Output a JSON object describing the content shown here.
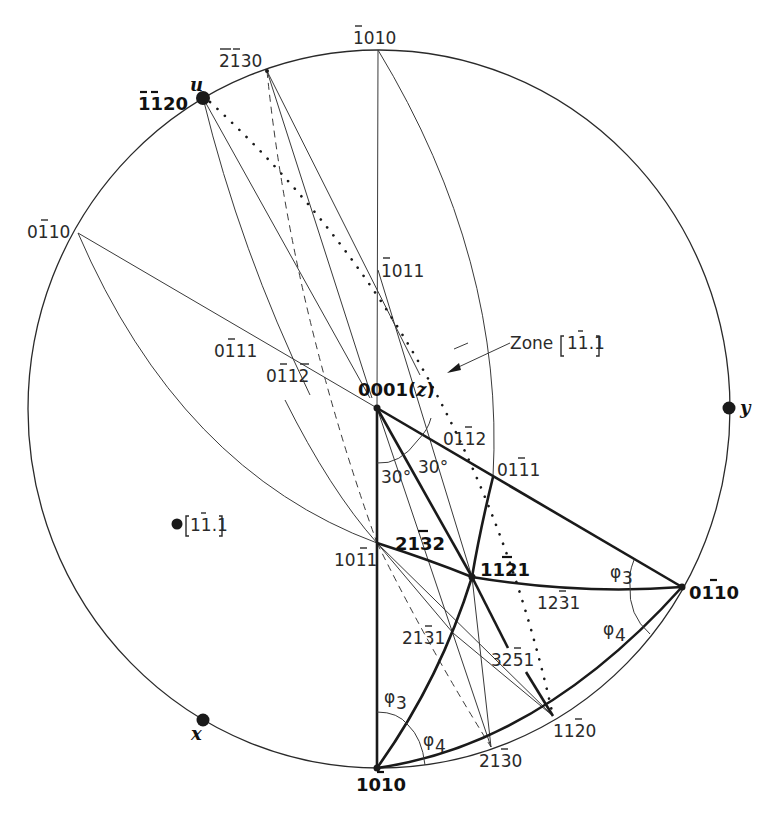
{
  "figure": {
    "primitive_circle": {
      "cx": 379,
      "cy": 409,
      "rx": 351,
      "ry": 359
    }
  },
  "poles": {
    "p0001": {
      "label": "0001",
      "suffix": "(z)",
      "x": 377,
      "y": 408
    },
    "p1010_top": {
      "label": "1̄010",
      "x": 378,
      "y": 50
    },
    "p2130_top": {
      "label": "2̄1̄30",
      "x": 267,
      "y": 71
    },
    "p1120_u": {
      "label": "1̄1̄20",
      "axis": "u",
      "x": 203,
      "y": 98
    },
    "p0110_left": {
      "label": "01̄10",
      "x": 78,
      "y": 233
    },
    "p1011_up": {
      "label": "1̄011",
      "x": 377,
      "y": 269
    },
    "p0111_left": {
      "label": "01̄11",
      "x": 259,
      "y": 340
    },
    "p0112_left": {
      "label": "01̄12̄",
      "x": 308,
      "y": 366
    },
    "p0112_right": {
      "label": "011̄2",
      "x": 444,
      "y": 448
    },
    "p0111_right": {
      "label": "011̄1",
      "x": 493,
      "y": 477
    },
    "p1011_down": {
      "label": "101̄1",
      "x": 377,
      "y": 543
    },
    "p2132": {
      "label": "213̄2",
      "x": 420,
      "y": 555
    },
    "p1121": {
      "label": "112̄1",
      "x": 472,
      "y": 577
    },
    "p0110_right": {
      "label": "011̄0",
      "x": 682,
      "y": 587
    },
    "p1231": {
      "label": "123̄1",
      "x": 525,
      "y": 592
    },
    "p2131": {
      "label": "213̄1",
      "x": 453,
      "y": 633
    },
    "p3251": {
      "label": "325̄1",
      "x": 515,
      "y": 671
    },
    "p1120_bottom": {
      "label": "112̄0",
      "x": 553,
      "y": 716
    },
    "p2130_bottom": {
      "label": "213̄0",
      "x": 491,
      "y": 747
    },
    "p1010_bottom": {
      "label": "101̄0",
      "x": 377,
      "y": 768
    },
    "y_axis": {
      "label": "y",
      "x": 729,
      "y": 408
    },
    "x_axis": {
      "label": "x",
      "x": 203,
      "y": 720
    },
    "zone_pole": {
      "label": "[11̄.1]",
      "x": 177,
      "y": 524
    }
  },
  "annotations": {
    "zone_label": "Zone [11̄.1]",
    "angle_30_left": "30°",
    "angle_30_right": "30°",
    "phi3_right": "φ3",
    "phi4_right": "φ4",
    "phi3_bottom": "φ3",
    "phi4_bottom": "φ4"
  },
  "labels_text": {
    "l1010_top": "1010",
    "l2130_top": "2130",
    "l1120_u": "1120",
    "u": "u",
    "l0110_left": "0110",
    "l1011_up": "1011",
    "l0111_left": "0111",
    "l0112_left": "0112",
    "l0001": "0001(",
    "z": "z",
    "close_paren": ")",
    "y": "y",
    "l0112_right": "0112",
    "l0111_right": "0111",
    "zone_word": "Zone",
    "zone_idx": "11.1",
    "zone_pole_idx": "11.1",
    "l1011_down": "1011",
    "l2132": "2132",
    "l1121": "1121",
    "l0110_right": "0110",
    "l1231": "1231",
    "l2131": "2131",
    "l3251": "3251",
    "l1120_bottom": "1120",
    "l2130_bottom": "2130",
    "l1010_bottom": "1010",
    "x": "x",
    "deg30a": "30°",
    "deg30b": "30°",
    "phi": "φ",
    "sub3": "3",
    "sub4": "4"
  }
}
